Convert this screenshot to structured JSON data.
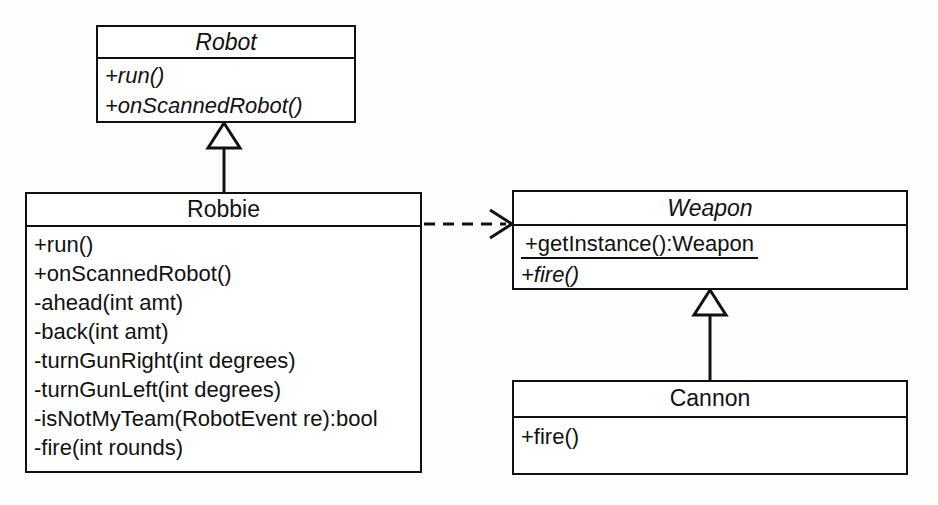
{
  "diagram": {
    "type": "uml-class-diagram",
    "background_color": "#fdfdfc",
    "line_color": "#111111",
    "fill_color": "#ffffff",
    "classes": [
      {
        "id": "robot",
        "name": "Robot",
        "abstract": true,
        "members": [
          {
            "text": "+run()",
            "abstract": true,
            "static": false
          },
          {
            "text": "+onScannedRobot()",
            "abstract": true,
            "static": false
          }
        ]
      },
      {
        "id": "robbie",
        "name": "Robbie",
        "abstract": false,
        "members": [
          {
            "text": "+run()",
            "abstract": false,
            "static": false
          },
          {
            "text": "+onScannedRobot()",
            "abstract": false,
            "static": false
          },
          {
            "text": "-ahead(int amt)",
            "abstract": false,
            "static": false
          },
          {
            "text": "-back(int amt)",
            "abstract": false,
            "static": false
          },
          {
            "text": "-turnGunRight(int degrees)",
            "abstract": false,
            "static": false
          },
          {
            "text": "-turnGunLeft(int degrees)",
            "abstract": false,
            "static": false
          },
          {
            "text": "-isNotMyTeam(RobotEvent re):bool",
            "abstract": false,
            "static": false
          },
          {
            "text": "-fire(int rounds)",
            "abstract": false,
            "static": false
          }
        ]
      },
      {
        "id": "weapon",
        "name": "Weapon",
        "abstract": true,
        "members": [
          {
            "text": "+getInstance():Weapon",
            "abstract": false,
            "static": true
          },
          {
            "text": "+fire()",
            "abstract": true,
            "static": false
          }
        ]
      },
      {
        "id": "cannon",
        "name": "Cannon",
        "abstract": false,
        "members": [
          {
            "text": "+fire()",
            "abstract": false,
            "static": false
          }
        ]
      }
    ],
    "relationships": [
      {
        "id": "robbie-generalizes-robot",
        "kind": "generalization",
        "from": "Robbie",
        "to": "Robot",
        "style": "solid",
        "arrowhead": "hollow-triangle"
      },
      {
        "id": "cannon-generalizes-weapon",
        "kind": "generalization",
        "from": "Cannon",
        "to": "Weapon",
        "style": "solid",
        "arrowhead": "hollow-triangle"
      },
      {
        "id": "robbie-depends-weapon",
        "kind": "dependency",
        "from": "Robbie",
        "to": "Weapon",
        "style": "dashed",
        "arrowhead": "open"
      }
    ]
  }
}
